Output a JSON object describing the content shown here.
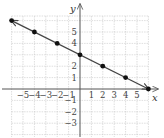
{
  "chart_data": {
    "type": "line",
    "title": "",
    "xlabel": "x",
    "ylabel": "y",
    "xlim": [
      -6,
      6
    ],
    "ylim": [
      -4,
      6
    ],
    "grid": true,
    "x_ticks": [
      -5,
      -4,
      -3,
      -2,
      -1,
      1,
      2,
      3,
      4,
      5
    ],
    "y_ticks": [
      5,
      4,
      2,
      1,
      -1,
      -2,
      -3
    ],
    "x_tick_labels": [
      "−5",
      "−4",
      "−3",
      "−2",
      "−1",
      "1",
      "2",
      "3",
      "4",
      "5"
    ],
    "y_tick_labels": [
      "5",
      "4",
      "2",
      "1",
      "−1",
      "−2",
      "−3"
    ],
    "series": [
      {
        "name": "line",
        "equation": "y = -x/2 + 3",
        "points": [
          [
            -6,
            6
          ],
          [
            -4,
            5
          ],
          [
            -2,
            4
          ],
          [
            0,
            3
          ],
          [
            2,
            2
          ],
          [
            4,
            1
          ],
          [
            6,
            0
          ]
        ],
        "arrows": "both"
      }
    ],
    "colors": {
      "line": "#444444",
      "points": "#111111",
      "grid": "#c8c8c8",
      "axes": "#555555"
    }
  }
}
